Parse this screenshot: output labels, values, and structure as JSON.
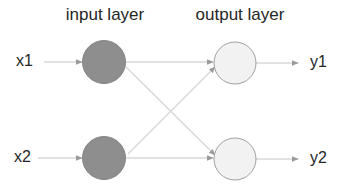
{
  "diagram": {
    "type": "neural-network",
    "layers": [
      {
        "title": "input layer",
        "nodes": [
          {
            "id": "in1",
            "input_label": "x1",
            "cx": 104,
            "cy": 62
          },
          {
            "id": "in2",
            "input_label": "x2",
            "cx": 104,
            "cy": 158
          }
        ]
      },
      {
        "title": "output layer",
        "nodes": [
          {
            "id": "out1",
            "output_label": "y1",
            "cx": 235,
            "cy": 63
          },
          {
            "id": "out2",
            "output_label": "y2",
            "cx": 235,
            "cy": 159
          }
        ]
      }
    ],
    "edges": [
      {
        "from": "x1",
        "to": "in1"
      },
      {
        "from": "x2",
        "to": "in2"
      },
      {
        "from": "in1",
        "to": "out1"
      },
      {
        "from": "in1",
        "to": "out2"
      },
      {
        "from": "in2",
        "to": "out1"
      },
      {
        "from": "in2",
        "to": "out2"
      },
      {
        "from": "out1",
        "to": "y1"
      },
      {
        "from": "out2",
        "to": "y2"
      }
    ],
    "labels": {
      "input_layer": "input layer",
      "output_layer": "output layer",
      "x1": "x1",
      "x2": "x2",
      "y1": "y1",
      "y2": "y2"
    },
    "colors": {
      "input_node_fill": "#8e8e8e",
      "output_node_fill": "#f2f2f2",
      "output_node_stroke": "#a0a0a0",
      "edge": "#c6c6c6",
      "arrowhead": "#9a9a9a",
      "text": "#262626"
    }
  }
}
